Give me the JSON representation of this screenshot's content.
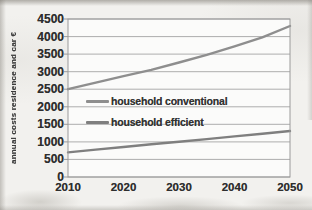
{
  "chart_data": {
    "type": "line",
    "title": "",
    "ylabel": "annual costs residence and car €",
    "xlabel": "",
    "x": [
      2010,
      2015,
      2020,
      2025,
      2030,
      2035,
      2040,
      2045,
      2050
    ],
    "series": [
      {
        "name": "household conventional",
        "color": "#8e8e8e",
        "values": [
          2500,
          2690,
          2870,
          3050,
          3260,
          3480,
          3720,
          3980,
          4300
        ]
      },
      {
        "name": "household efficient",
        "color": "#7f7f7f",
        "values": [
          700,
          780,
          855,
          930,
          1005,
          1080,
          1155,
          1230,
          1310
        ]
      }
    ],
    "ylim": [
      0,
      4500
    ],
    "ytick_step": 500,
    "yticks": [
      0,
      500,
      1000,
      1500,
      2000,
      2500,
      3000,
      3500,
      4000,
      4500
    ],
    "xticks": [
      2010,
      2020,
      2030,
      2040,
      2050
    ],
    "grid": "horizontal",
    "legend_position": "inside-middle-left",
    "colors": {
      "grid": "#adadad",
      "border": "#9a9a9a",
      "tick_text": "#2e2e2e",
      "plot_bg": "#fbfbfa",
      "paper": "#f2f1ee"
    }
  }
}
